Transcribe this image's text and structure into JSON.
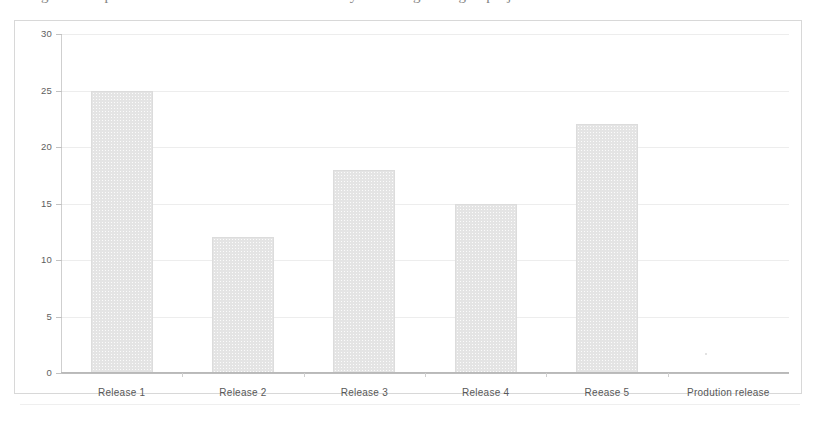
{
  "document": {
    "clipped_top_text": "Figure 1 : Open defects at the end of each release cycle during the Agile project"
  },
  "chart_data": {
    "type": "bar",
    "title": "",
    "xlabel": "",
    "ylabel": "",
    "categories": [
      "Release 1",
      "Release 2",
      "Release 3",
      "Release 4",
      "Reease 5",
      "Prodution release"
    ],
    "values": [
      25,
      12,
      18,
      15,
      22,
      0
    ],
    "ylim": [
      0,
      30
    ],
    "yticks": [
      0,
      5,
      10,
      15,
      20,
      25,
      30
    ],
    "ytick_labels": [
      "0",
      "5",
      "10",
      "15",
      "20",
      "25",
      "30"
    ],
    "grid": true,
    "legend": null,
    "series": [
      {
        "name": "defects",
        "values": [
          25,
          12,
          18,
          15,
          22,
          0
        ]
      }
    ],
    "bar_color": "#e4e4e4",
    "grid_color": "#ededed",
    "axis_color": "#bdbdbd"
  }
}
